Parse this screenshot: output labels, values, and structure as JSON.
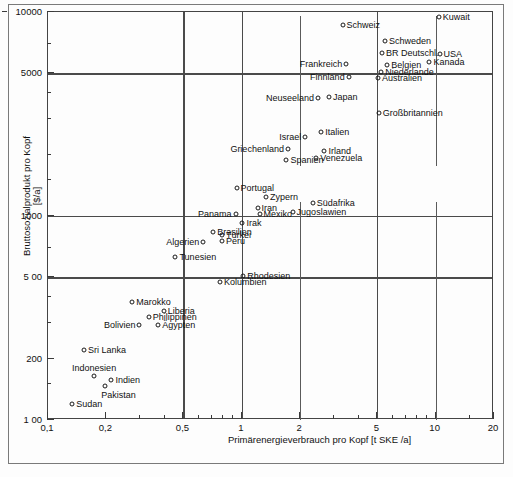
{
  "chart_data": {
    "type": "scatter",
    "title": "",
    "xlabel": "Primärenergieverbrauch pro Kopf  [t SKE /a]",
    "ylabel_line1": "Bruttosozialprodukt pro Kopf",
    "ylabel_line2": "[$/a]",
    "xscale": "log",
    "yscale": "log",
    "xlim": [
      0.1,
      20
    ],
    "ylim": [
      100,
      10000
    ],
    "grid": true,
    "legend": "none",
    "xticks_major": [
      {
        "value": 0.1,
        "label": "0,1"
      },
      {
        "value": 0.2,
        "label": "0,2"
      },
      {
        "value": 0.5,
        "label": "0,5"
      },
      {
        "value": 1,
        "label": "1"
      },
      {
        "value": 2,
        "label": "2"
      },
      {
        "value": 5,
        "label": "5"
      },
      {
        "value": 10,
        "label": "10"
      },
      {
        "value": 20,
        "label": "20"
      }
    ],
    "xticks_minor": [
      0.3,
      0.4,
      0.6,
      0.7,
      0.8,
      0.9,
      3,
      4,
      6,
      7,
      8,
      9,
      15
    ],
    "yticks_major": [
      {
        "value": 100,
        "label": "1 00"
      },
      {
        "value": 200,
        "label": "200"
      },
      {
        "value": 500,
        "label": "5 00"
      },
      {
        "value": 1000,
        "label": "1000"
      },
      {
        "value": 5000,
        "label": "5000"
      },
      {
        "value": 10000,
        "label": "10000"
      }
    ],
    "yticks_minor": [
      150,
      300,
      400,
      700,
      1500,
      2000,
      3000,
      4000,
      7000
    ],
    "gridlines_x": [
      0.5,
      1,
      5
    ],
    "gridlines_y": [
      500,
      1000,
      5000
    ],
    "points": [
      {
        "name": "Kuwait",
        "x": 10.5,
        "y": 9300,
        "label_side": "right"
      },
      {
        "name": "Schweiz",
        "x": 3.35,
        "y": 8500,
        "label_side": "right"
      },
      {
        "name": "Schweden",
        "x": 5.55,
        "y": 7100,
        "label_side": "right"
      },
      {
        "name": "BR Deutschl.",
        "x": 5.35,
        "y": 6200,
        "label_side": "right"
      },
      {
        "name": "USA",
        "x": 10.6,
        "y": 6150,
        "label_side": "right"
      },
      {
        "name": "Kanada",
        "x": 9.4,
        "y": 5650,
        "label_side": "right"
      },
      {
        "name": "Frankreich",
        "x": 3.5,
        "y": 5500,
        "label_side": "left"
      },
      {
        "name": "Belgien",
        "x": 5.7,
        "y": 5450,
        "label_side": "right"
      },
      {
        "name": "Niederlande",
        "x": 5.3,
        "y": 5050,
        "label_side": "right"
      },
      {
        "name": "Finnland",
        "x": 3.6,
        "y": 4750,
        "label_side": "left"
      },
      {
        "name": "Australien",
        "x": 5.1,
        "y": 4700,
        "label_side": "right"
      },
      {
        "name": "Neuseeland",
        "x": 2.5,
        "y": 3750,
        "label_side": "left"
      },
      {
        "name": "Japan",
        "x": 2.85,
        "y": 3800,
        "label_side": "right"
      },
      {
        "name": "Großbritannien",
        "x": 5.15,
        "y": 3150,
        "label_side": "right"
      },
      {
        "name": "Italien",
        "x": 2.6,
        "y": 2550,
        "label_side": "right"
      },
      {
        "name": "Israel",
        "x": 2.15,
        "y": 2400,
        "label_side": "left"
      },
      {
        "name": "Irland",
        "x": 2.7,
        "y": 2050,
        "label_side": "right"
      },
      {
        "name": "Griechenland",
        "x": 1.75,
        "y": 2100,
        "label_side": "left"
      },
      {
        "name": "Venezuela",
        "x": 2.45,
        "y": 1900,
        "label_side": "right"
      },
      {
        "name": "Spanien",
        "x": 1.72,
        "y": 1850,
        "label_side": "right"
      },
      {
        "name": "Portugal",
        "x": 0.95,
        "y": 1350,
        "label_side": "right"
      },
      {
        "name": "Zypern",
        "x": 1.35,
        "y": 1220,
        "label_side": "right"
      },
      {
        "name": "Südafrika",
        "x": 2.35,
        "y": 1150,
        "label_side": "right"
      },
      {
        "name": "Iran",
        "x": 1.22,
        "y": 1080,
        "label_side": "right"
      },
      {
        "name": "Mexiko",
        "x": 1.25,
        "y": 1010,
        "label_side": "right"
      },
      {
        "name": "Jugoslawien",
        "x": 1.85,
        "y": 1040,
        "label_side": "right"
      },
      {
        "name": "Panama",
        "x": 0.94,
        "y": 1010,
        "label_side": "left"
      },
      {
        "name": "Irak",
        "x": 1.02,
        "y": 910,
        "label_side": "right"
      },
      {
        "name": "Brasilien",
        "x": 0.72,
        "y": 830,
        "label_side": "right"
      },
      {
        "name": "Türkei",
        "x": 0.8,
        "y": 800,
        "label_side": "right"
      },
      {
        "name": "Peru",
        "x": 0.8,
        "y": 745,
        "label_side": "right"
      },
      {
        "name": "Algerien",
        "x": 0.64,
        "y": 740,
        "label_side": "left"
      },
      {
        "name": "Tunesien",
        "x": 0.46,
        "y": 620,
        "label_side": "right"
      },
      {
        "name": "Rhodesien",
        "x": 1.03,
        "y": 500,
        "label_side": "right"
      },
      {
        "name": "Kolumbien",
        "x": 0.78,
        "y": 470,
        "label_side": "right"
      },
      {
        "name": "Marokko",
        "x": 0.275,
        "y": 375,
        "label_side": "right"
      },
      {
        "name": "Liberia",
        "x": 0.4,
        "y": 340,
        "label_side": "right"
      },
      {
        "name": "Philippinen",
        "x": 0.335,
        "y": 318,
        "label_side": "right"
      },
      {
        "name": "Ägypten",
        "x": 0.375,
        "y": 290,
        "label_side": "right"
      },
      {
        "name": "Bolivien",
        "x": 0.3,
        "y": 290,
        "label_side": "left"
      },
      {
        "name": "Sri Lanka",
        "x": 0.155,
        "y": 218,
        "label_side": "right"
      },
      {
        "name": "Indonesien",
        "x": 0.175,
        "y": 163,
        "label_side": "top"
      },
      {
        "name": "Indien",
        "x": 0.215,
        "y": 155,
        "label_side": "right"
      },
      {
        "name": "Pakistan",
        "x": 0.2,
        "y": 145,
        "label_side": "bottom"
      },
      {
        "name": "Sudan",
        "x": 0.135,
        "y": 118,
        "label_side": "right"
      }
    ]
  }
}
